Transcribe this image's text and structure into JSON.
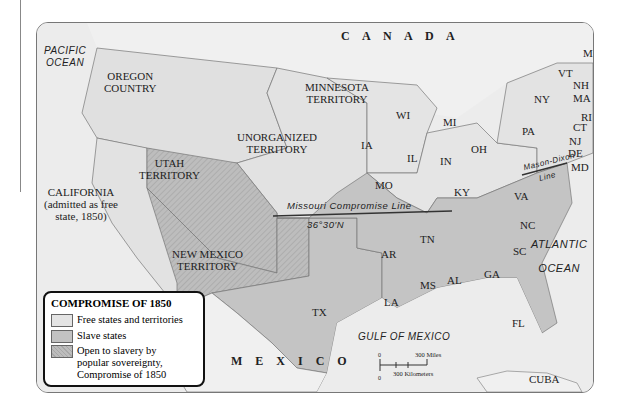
{
  "map": {
    "title": "Compromise of 1850",
    "colors": {
      "free": "#e4e4e4",
      "slave": "#c2c2c2",
      "popular_sovereignty": "#b5b5b5",
      "water": "#ececec",
      "foreign": "#f1f1f1"
    },
    "regions": {
      "canada": "C A N A D A",
      "mexico": "M E X I C O",
      "cuba": "CUBA"
    },
    "water": {
      "pacific": "PACIFIC",
      "pacific2": "OCEAN",
      "atlantic": "ATLANTIC",
      "atlantic2": "OCEAN",
      "gulf": "GULF OF MEXICO"
    },
    "territories": {
      "oregon1": "OREGON",
      "oregon2": "COUNTRY",
      "minnesota1": "MINNESOTA",
      "minnesota2": "TERRITORY",
      "unorganized1": "UNORGANIZED",
      "unorganized2": "TERRITORY",
      "utah1": "UTAH",
      "utah2": "TERRITORY",
      "newmexico1": "NEW MEXICO",
      "newmexico2": "TERRITORY",
      "california1": "CALIFORNIA",
      "california2": "(admitted as free",
      "california3": "state, 1850)"
    },
    "states": [
      "WI",
      "MI",
      "IA",
      "IL",
      "IN",
      "OH",
      "NY",
      "PA",
      "VT",
      "NH",
      "MA",
      "RI",
      "CT",
      "NJ",
      "DE",
      "MD",
      "ME",
      "MO",
      "KY",
      "VA",
      "NC",
      "TN",
      "SC",
      "AR",
      "MS",
      "AL",
      "GA",
      "LA",
      "TX",
      "FL"
    ],
    "lines": {
      "missouri": "Missouri Compromise Line",
      "latitude": "36°30′N",
      "mason_dixon1": "Mason-Dixon",
      "mason_dixon2": "Line"
    },
    "scale": {
      "zero_top": "0",
      "zero_bottom": "0",
      "miles": "300 Miles",
      "km": "300 Kilometers"
    }
  },
  "legend": {
    "title": "COMPROMISE OF 1850",
    "items": [
      {
        "label": "Free states and territories"
      },
      {
        "label": "Slave states"
      },
      {
        "label": "Open to slavery by",
        "label2": "popular sovereignty,",
        "label3": "Compromise of 1850"
      }
    ]
  }
}
